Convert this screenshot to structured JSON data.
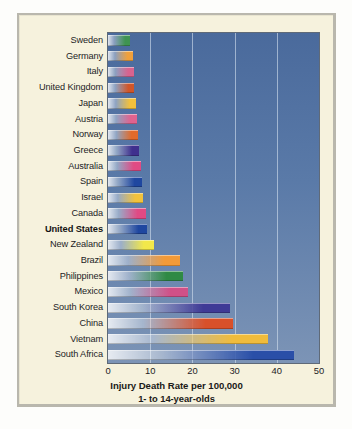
{
  "chart_data": {
    "type": "bar",
    "orientation": "horizontal",
    "title": "",
    "xlabel": "Injury Death Rate per 100,000",
    "xlabel_line2": "1- to 14-year-olds",
    "ylabel": "",
    "xlim": [
      0,
      50
    ],
    "xticks": [
      0,
      10,
      20,
      30,
      40,
      50
    ],
    "xtick_labels": [
      "0",
      "10",
      "20",
      "30",
      "40",
      "50"
    ],
    "grid": true,
    "grid_axis": "x",
    "legend": "none",
    "highlight_category": "United States",
    "categories": [
      "Sweden",
      "Germany",
      "Italy",
      "United Kingdom",
      "Japan",
      "Austria",
      "Norway",
      "Greece",
      "Australia",
      "Spain",
      "Israel",
      "Canada",
      "United States",
      "New Zealand",
      "Brazil",
      "Philippines",
      "Mexico",
      "South Korea",
      "China",
      "Vietnam",
      "South Africa"
    ],
    "values": [
      5.2,
      6.0,
      6.1,
      6.1,
      6.6,
      6.8,
      7.0,
      7.4,
      7.8,
      8.1,
      8.3,
      9.1,
      9.2,
      10.9,
      17.0,
      17.8,
      19.0,
      29.0,
      29.6,
      38.0,
      44.0
    ],
    "bar_colors": [
      "#3f9452",
      "#f0a03c",
      "#d8638f",
      "#d0562a",
      "#f2c03c",
      "#e0638f",
      "#e06a2a",
      "#3f2f8e",
      "#e04a84",
      "#1f47a0",
      "#f2c23c",
      "#e04a84",
      "#1f47a0",
      "#f2e84a",
      "#f29a38",
      "#2f8a44",
      "#d05088",
      "#3f3a96",
      "#d8502a",
      "#f0bc3c",
      "#2a4fa8"
    ]
  },
  "figure": {
    "panel_background": "#f6f2dd",
    "plot_background": "#5a7aa8",
    "frame_color": "#b9b7ad",
    "gridline_color": "#d2deee",
    "text_color": "#23221f"
  }
}
